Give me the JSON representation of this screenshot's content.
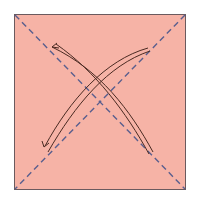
{
  "diagram": {
    "type": "origami-fold-instruction",
    "paper": {
      "x": 14,
      "y": 14,
      "width": 172,
      "height": 176,
      "fill": "#f6b3a6",
      "stroke": "#6b5a5e"
    },
    "fold_lines": [
      {
        "name": "diagonal-top-left-to-bottom-right",
        "style": "dashed",
        "color": "#5a5f8e"
      },
      {
        "name": "diagonal-top-right-to-bottom-left",
        "style": "dashed",
        "color": "#5a5f8e"
      }
    ],
    "arrows": [
      {
        "name": "fold-unfold-arrow-bottom-right-to-top-left",
        "color": "#4a2a22"
      },
      {
        "name": "fold-unfold-arrow-top-right-to-bottom-left",
        "color": "#4a2a22"
      }
    ]
  }
}
